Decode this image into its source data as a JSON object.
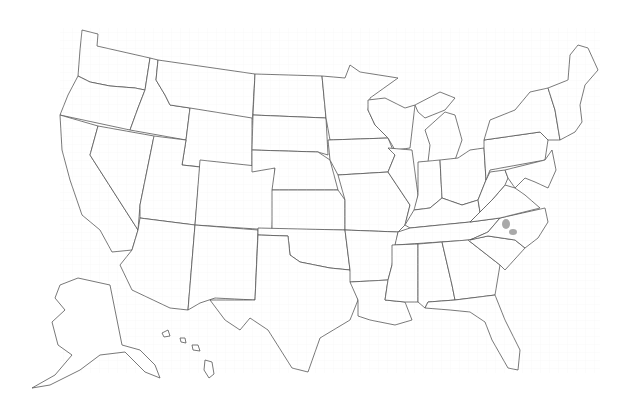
{
  "map": {
    "title": "",
    "type": "choropleth",
    "region": "United States (counties)",
    "colors": {
      "background": "#ffffff",
      "state_border": "#555555",
      "county_border": "#e3e3e3",
      "highlight": "#9a9a9a"
    },
    "highlighted_counties": [
      {
        "state": "North Carolina",
        "x": 506,
        "y": 224
      },
      {
        "state": "North Carolina",
        "x": 513,
        "y": 232
      }
    ],
    "legend": null
  }
}
